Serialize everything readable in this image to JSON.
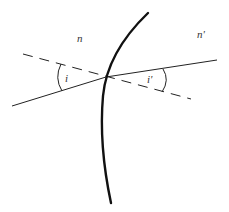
{
  "diagram": {
    "labels": {
      "medium_left": "n",
      "medium_right": "n'",
      "angle_incidence": "i",
      "angle_refraction": "i'"
    },
    "colors": {
      "background": "#ffffff",
      "stroke": "#222222",
      "text": "#333333"
    },
    "elements": {
      "interface": "thick curved surface boundary",
      "incident_ray": "solid line from lower-left to intersection",
      "refracted_ray": "solid line from intersection to upper-right",
      "normal": "dashed line through intersection"
    }
  }
}
